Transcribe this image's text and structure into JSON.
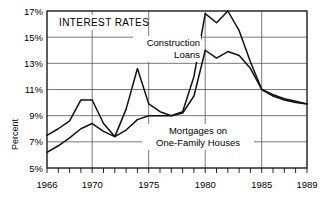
{
  "chart_data": {
    "type": "line",
    "title": "INTEREST RATES",
    "xlabel": "",
    "ylabel": "Percent",
    "xlim": [
      1966,
      1989
    ],
    "ylim": [
      5,
      17
    ],
    "grid": true,
    "legend_position": "inline-annotations",
    "ytick_labels": [
      "5%",
      "7%",
      "9%",
      "11%",
      "13%",
      "15%",
      "17%"
    ],
    "ytick_values": [
      5,
      7,
      9,
      11,
      13,
      15,
      17
    ],
    "xtick_labels": [
      "1966",
      "1970",
      "1975",
      "1980",
      "1985",
      "1989"
    ],
    "xtick_values": [
      1966,
      1970,
      1975,
      1980,
      1985,
      1989
    ],
    "x": [
      1966,
      1967,
      1968,
      1969,
      1970,
      1971,
      1972,
      1973,
      1974,
      1975,
      1976,
      1977,
      1978,
      1979,
      1980,
      1981,
      1982,
      1983,
      1984,
      1985,
      1986,
      1987,
      1988,
      1989
    ],
    "series": [
      {
        "name": "Construction Loans",
        "label_line_1": "Construction",
        "label_line_2": "Loans",
        "color": "#111111",
        "values": [
          7.5,
          8.0,
          8.6,
          10.2,
          10.2,
          8.4,
          7.4,
          9.5,
          12.6,
          9.9,
          9.3,
          9.0,
          9.3,
          12.0,
          16.8,
          16.1,
          17.0,
          15.5,
          13.1,
          11.0,
          10.5,
          10.2,
          10.0,
          9.9
        ]
      },
      {
        "name": "Mortgages on One-Family Houses",
        "label_line_1": "Mortgages on",
        "label_line_2": "One-Family Houses",
        "color": "#111111",
        "values": [
          6.2,
          6.7,
          7.3,
          8.0,
          8.4,
          7.8,
          7.4,
          7.9,
          8.7,
          9.0,
          9.0,
          9.0,
          9.2,
          10.5,
          14.0,
          13.4,
          13.9,
          13.6,
          12.6,
          11.0,
          10.6,
          10.3,
          10.1,
          9.9
        ]
      }
    ]
  },
  "labels": {
    "title": "INTEREST RATES",
    "y_axis_title": "Percent",
    "annotation_construction_1": "Construction",
    "annotation_construction_2": "Loans",
    "annotation_mortgage_1": "Mortgages on",
    "annotation_mortgage_2": "One-Family Houses",
    "ytick_5": "5%",
    "ytick_7": "7%",
    "ytick_9": "9%",
    "ytick_11": "11%",
    "ytick_13": "13%",
    "ytick_15": "15%",
    "ytick_17": "17%",
    "xtick_1966": "1966",
    "xtick_1970": "1970",
    "xtick_1975": "1975",
    "xtick_1980": "1980",
    "xtick_1985": "1985",
    "xtick_1989": "1989"
  }
}
